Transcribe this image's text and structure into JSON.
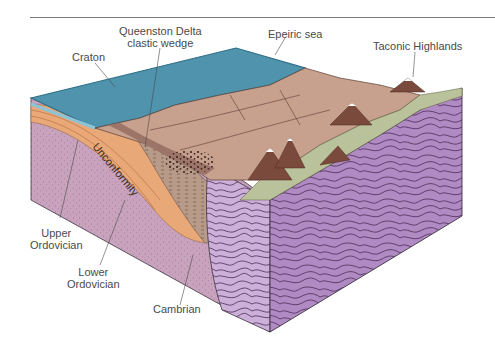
{
  "figure": {
    "title_rule": true,
    "labels": {
      "queenston_line1": "Queenston Delta",
      "queenston_line2": "clastic wedge",
      "craton": "Craton",
      "epeiric_sea": "Epeiric sea",
      "taconic_highlands": "Taconic Highlands",
      "unconformity": "Unconformity",
      "upper_ordovician_line1": "Upper",
      "upper_ordovician_line2": "Ordovician",
      "lower_ordovician_line1": "Lower",
      "lower_ordovician_line2": "Ordovician",
      "cambrian": "Cambrian"
    },
    "colors": {
      "sea": "#4f93ad",
      "sea_edge": "#2f6f88",
      "delta_surface": "#c7a08e",
      "delta_dark": "#9c7468",
      "lowland_green": "#b9c29a",
      "mountain": "#7a4a3c",
      "cambrian_face": "#c9a3bd",
      "ordovician_orange": "#e9a878",
      "basement_purple_light": "#c2a0cf",
      "basement_purple_dark": "#9c6fb0",
      "contour_line": "#4a2a55",
      "label_text": "#4a4a4a"
    }
  }
}
